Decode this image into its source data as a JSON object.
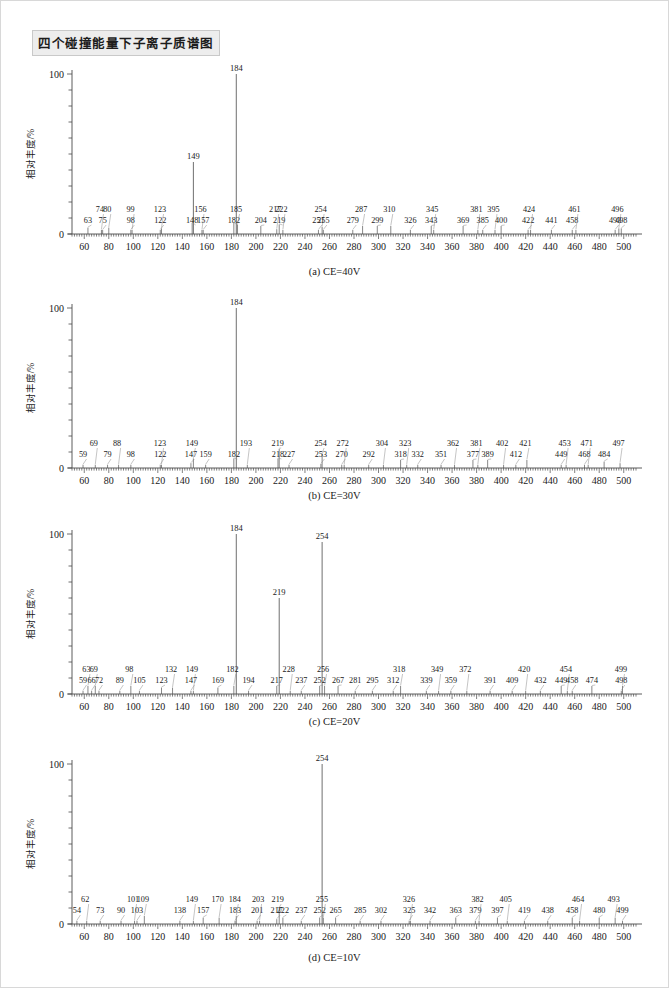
{
  "document": {
    "title": "四个碰撞能量下子离子质谱图"
  },
  "axis": {
    "y_label": "相对丰度/%",
    "x_label": "m/z",
    "y_ticks_labeled": [
      "100",
      "0"
    ],
    "x_ticks_labeled": [
      "60",
      "80",
      "100",
      "120",
      "140",
      "160",
      "180",
      "200",
      "220",
      "240",
      "260",
      "280",
      "300",
      "320",
      "340",
      "360",
      "380",
      "400",
      "420",
      "440",
      "460",
      "480",
      "500"
    ],
    "x_min": 50,
    "x_max": 510,
    "y_min": 0,
    "y_max": 100
  },
  "chart_data": [
    {
      "type": "bar",
      "id": "spectrum-a",
      "title": "(a) CE=40V",
      "xlabel": "m/z",
      "ylabel": "相对丰度/%",
      "xlim": [
        50,
        510
      ],
      "ylim": [
        0,
        100
      ],
      "grid": false,
      "base_peak": 184,
      "peaks": [
        {
          "mz": 63,
          "intensity": 4
        },
        {
          "mz": 74,
          "intensity": 2.5
        },
        {
          "mz": 75,
          "intensity": 2.5
        },
        {
          "mz": 80,
          "intensity": 4
        },
        {
          "mz": 98,
          "intensity": 2.5
        },
        {
          "mz": 99,
          "intensity": 2.5
        },
        {
          "mz": 122,
          "intensity": 2.5
        },
        {
          "mz": 123,
          "intensity": 3.5
        },
        {
          "mz": 148,
          "intensity": 7
        },
        {
          "mz": 149,
          "intensity": 45
        },
        {
          "mz": 156,
          "intensity": 2.5
        },
        {
          "mz": 157,
          "intensity": 2.5
        },
        {
          "mz": 182,
          "intensity": 7
        },
        {
          "mz": 184,
          "intensity": 100
        },
        {
          "mz": 185,
          "intensity": 6
        },
        {
          "mz": 204,
          "intensity": 5
        },
        {
          "mz": 217,
          "intensity": 3
        },
        {
          "mz": 219,
          "intensity": 6
        },
        {
          "mz": 222,
          "intensity": 2.5
        },
        {
          "mz": 251,
          "intensity": 2.5
        },
        {
          "mz": 254,
          "intensity": 4.5
        },
        {
          "mz": 255,
          "intensity": 2.5
        },
        {
          "mz": 279,
          "intensity": 2.5
        },
        {
          "mz": 287,
          "intensity": 5
        },
        {
          "mz": 299,
          "intensity": 5
        },
        {
          "mz": 310,
          "intensity": 5
        },
        {
          "mz": 326,
          "intensity": 2.5
        },
        {
          "mz": 343,
          "intensity": 5
        },
        {
          "mz": 345,
          "intensity": 2.5
        },
        {
          "mz": 369,
          "intensity": 5
        },
        {
          "mz": 381,
          "intensity": 2.5
        },
        {
          "mz": 385,
          "intensity": 2.5
        },
        {
          "mz": 395,
          "intensity": 2.5
        },
        {
          "mz": 400,
          "intensity": 5
        },
        {
          "mz": 422,
          "intensity": 2.5
        },
        {
          "mz": 424,
          "intensity": 2.5
        },
        {
          "mz": 441,
          "intensity": 2.5
        },
        {
          "mz": 458,
          "intensity": 2.5
        },
        {
          "mz": 461,
          "intensity": 2.5
        },
        {
          "mz": 493,
          "intensity": 2.5
        },
        {
          "mz": 496,
          "intensity": 3.5
        },
        {
          "mz": 498,
          "intensity": 3.5
        }
      ]
    },
    {
      "type": "bar",
      "id": "spectrum-b",
      "title": "(b) CE=30V",
      "xlabel": "m/z",
      "ylabel": "相对丰度/%",
      "xlim": [
        50,
        510
      ],
      "ylim": [
        0,
        100
      ],
      "grid": false,
      "base_peak": 184,
      "peaks": [
        {
          "mz": 59,
          "intensity": 2
        },
        {
          "mz": 69,
          "intensity": 2
        },
        {
          "mz": 79,
          "intensity": 2
        },
        {
          "mz": 88,
          "intensity": 2
        },
        {
          "mz": 98,
          "intensity": 2
        },
        {
          "mz": 122,
          "intensity": 2
        },
        {
          "mz": 123,
          "intensity": 2
        },
        {
          "mz": 147,
          "intensity": 3
        },
        {
          "mz": 149,
          "intensity": 6
        },
        {
          "mz": 159,
          "intensity": 2
        },
        {
          "mz": 182,
          "intensity": 6
        },
        {
          "mz": 184,
          "intensity": 100
        },
        {
          "mz": 193,
          "intensity": 2
        },
        {
          "mz": 218,
          "intensity": 6
        },
        {
          "mz": 219,
          "intensity": 12
        },
        {
          "mz": 227,
          "intensity": 2
        },
        {
          "mz": 253,
          "intensity": 2.5
        },
        {
          "mz": 254,
          "intensity": 9
        },
        {
          "mz": 270,
          "intensity": 2
        },
        {
          "mz": 272,
          "intensity": 2
        },
        {
          "mz": 292,
          "intensity": 2
        },
        {
          "mz": 304,
          "intensity": 2
        },
        {
          "mz": 318,
          "intensity": 5
        },
        {
          "mz": 323,
          "intensity": 2
        },
        {
          "mz": 332,
          "intensity": 2
        },
        {
          "mz": 351,
          "intensity": 2
        },
        {
          "mz": 362,
          "intensity": 2
        },
        {
          "mz": 377,
          "intensity": 5
        },
        {
          "mz": 381,
          "intensity": 2
        },
        {
          "mz": 389,
          "intensity": 5
        },
        {
          "mz": 402,
          "intensity": 2
        },
        {
          "mz": 412,
          "intensity": 2
        },
        {
          "mz": 421,
          "intensity": 5
        },
        {
          "mz": 449,
          "intensity": 2
        },
        {
          "mz": 453,
          "intensity": 2
        },
        {
          "mz": 468,
          "intensity": 2
        },
        {
          "mz": 471,
          "intensity": 2
        },
        {
          "mz": 484,
          "intensity": 4
        },
        {
          "mz": 497,
          "intensity": 3
        }
      ]
    },
    {
      "type": "bar",
      "id": "spectrum-c",
      "title": "(c) CE=20V",
      "xlabel": "m/z",
      "ylabel": "相对丰度/%",
      "xlim": [
        50,
        510
      ],
      "ylim": [
        0,
        100
      ],
      "grid": false,
      "base_peak": 184,
      "peaks": [
        {
          "mz": 59,
          "intensity": 2
        },
        {
          "mz": 63,
          "intensity": 5
        },
        {
          "mz": 66,
          "intensity": 2
        },
        {
          "mz": 69,
          "intensity": 5
        },
        {
          "mz": 72,
          "intensity": 2
        },
        {
          "mz": 89,
          "intensity": 2
        },
        {
          "mz": 98,
          "intensity": 5
        },
        {
          "mz": 105,
          "intensity": 2
        },
        {
          "mz": 123,
          "intensity": 4
        },
        {
          "mz": 132,
          "intensity": 4
        },
        {
          "mz": 147,
          "intensity": 2
        },
        {
          "mz": 149,
          "intensity": 2
        },
        {
          "mz": 169,
          "intensity": 4
        },
        {
          "mz": 182,
          "intensity": 5
        },
        {
          "mz": 184,
          "intensity": 100
        },
        {
          "mz": 194,
          "intensity": 2
        },
        {
          "mz": 217,
          "intensity": 5
        },
        {
          "mz": 219,
          "intensity": 60
        },
        {
          "mz": 228,
          "intensity": 2
        },
        {
          "mz": 237,
          "intensity": 2
        },
        {
          "mz": 252,
          "intensity": 5
        },
        {
          "mz": 254,
          "intensity": 95
        },
        {
          "mz": 256,
          "intensity": 5
        },
        {
          "mz": 267,
          "intensity": 5
        },
        {
          "mz": 281,
          "intensity": 2
        },
        {
          "mz": 295,
          "intensity": 2
        },
        {
          "mz": 312,
          "intensity": 2
        },
        {
          "mz": 318,
          "intensity": 5
        },
        {
          "mz": 339,
          "intensity": 2
        },
        {
          "mz": 349,
          "intensity": 2
        },
        {
          "mz": 359,
          "intensity": 2
        },
        {
          "mz": 372,
          "intensity": 2
        },
        {
          "mz": 391,
          "intensity": 2
        },
        {
          "mz": 409,
          "intensity": 2
        },
        {
          "mz": 420,
          "intensity": 2
        },
        {
          "mz": 432,
          "intensity": 2
        },
        {
          "mz": 449,
          "intensity": 5
        },
        {
          "mz": 454,
          "intensity": 2
        },
        {
          "mz": 458,
          "intensity": 2
        },
        {
          "mz": 474,
          "intensity": 5
        },
        {
          "mz": 498,
          "intensity": 2
        },
        {
          "mz": 499,
          "intensity": 5
        }
      ]
    },
    {
      "type": "bar",
      "id": "spectrum-d",
      "title": "(d) CE=10V",
      "xlabel": "m/z",
      "ylabel": "相对丰度/%",
      "xlim": [
        50,
        510
      ],
      "ylim": [
        0,
        100
      ],
      "grid": false,
      "base_peak": 254,
      "peaks": [
        {
          "mz": 54,
          "intensity": 2
        },
        {
          "mz": 62,
          "intensity": 2
        },
        {
          "mz": 73,
          "intensity": 2
        },
        {
          "mz": 90,
          "intensity": 2
        },
        {
          "mz": 101,
          "intensity": 2
        },
        {
          "mz": 103,
          "intensity": 2
        },
        {
          "mz": 109,
          "intensity": 5
        },
        {
          "mz": 138,
          "intensity": 2
        },
        {
          "mz": 149,
          "intensity": 2
        },
        {
          "mz": 157,
          "intensity": 4
        },
        {
          "mz": 170,
          "intensity": 4
        },
        {
          "mz": 183,
          "intensity": 2
        },
        {
          "mz": 184,
          "intensity": 5
        },
        {
          "mz": 201,
          "intensity": 2
        },
        {
          "mz": 203,
          "intensity": 2
        },
        {
          "mz": 217,
          "intensity": 3
        },
        {
          "mz": 219,
          "intensity": 10
        },
        {
          "mz": 222,
          "intensity": 4
        },
        {
          "mz": 237,
          "intensity": 2
        },
        {
          "mz": 252,
          "intensity": 4
        },
        {
          "mz": 254,
          "intensity": 100
        },
        {
          "mz": 255,
          "intensity": 4
        },
        {
          "mz": 265,
          "intensity": 4
        },
        {
          "mz": 285,
          "intensity": 2
        },
        {
          "mz": 302,
          "intensity": 2
        },
        {
          "mz": 325,
          "intensity": 2
        },
        {
          "mz": 326,
          "intensity": 2
        },
        {
          "mz": 342,
          "intensity": 2
        },
        {
          "mz": 363,
          "intensity": 4
        },
        {
          "mz": 379,
          "intensity": 2
        },
        {
          "mz": 382,
          "intensity": 2
        },
        {
          "mz": 397,
          "intensity": 4
        },
        {
          "mz": 405,
          "intensity": 2
        },
        {
          "mz": 419,
          "intensity": 2
        },
        {
          "mz": 438,
          "intensity": 2
        },
        {
          "mz": 458,
          "intensity": 4
        },
        {
          "mz": 464,
          "intensity": 2
        },
        {
          "mz": 480,
          "intensity": 4
        },
        {
          "mz": 493,
          "intensity": 4
        },
        {
          "mz": 499,
          "intensity": 2
        }
      ]
    }
  ]
}
